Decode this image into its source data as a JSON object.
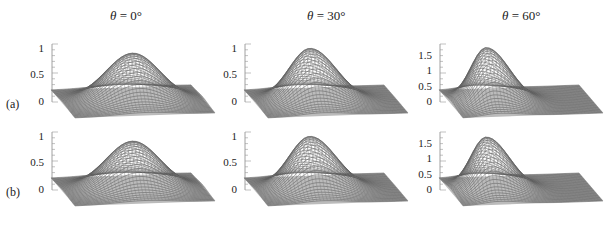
{
  "chart_data": {
    "type": "surface3d",
    "columns": [
      {
        "title_var": "θ",
        "title_rest": " = 0°",
        "theta_deg": 0
      },
      {
        "title_var": "θ",
        "title_rest": " = 30°",
        "theta_deg": 30
      },
      {
        "title_var": "θ",
        "title_rest": " = 60°",
        "theta_deg": 60
      }
    ],
    "rows": [
      {
        "label": "(a)"
      },
      {
        "label": "(b)"
      }
    ],
    "panels": [
      {
        "row": 0,
        "col": 0,
        "zticks": [
          "1",
          "0.5",
          "0"
        ],
        "zmax": 1.0,
        "peak": 0.9,
        "skew": 0.0,
        "width": 0.55
      },
      {
        "row": 0,
        "col": 1,
        "zticks": [
          "1",
          "0.5",
          "0"
        ],
        "zmax": 1.0,
        "peak": 1.0,
        "skew": 0.25,
        "width": 0.42
      },
      {
        "row": 0,
        "col": 2,
        "zticks": [
          "1.5",
          "1",
          "0.5",
          "0"
        ],
        "zmax": 1.8,
        "peak": 1.85,
        "skew": 0.55,
        "width": 0.3
      },
      {
        "row": 1,
        "col": 0,
        "zticks": [
          "1",
          "0.5",
          "0"
        ],
        "zmax": 1.0,
        "peak": 0.9,
        "skew": 0.0,
        "width": 0.55
      },
      {
        "row": 1,
        "col": 1,
        "zticks": [
          "1",
          "0.5",
          "0"
        ],
        "zmax": 1.0,
        "peak": 1.0,
        "skew": 0.25,
        "width": 0.42
      },
      {
        "row": 1,
        "col": 2,
        "zticks": [
          "1.5",
          "1",
          "0.5",
          "0"
        ],
        "zmax": 1.8,
        "peak": 1.8,
        "skew": 0.55,
        "width": 0.3
      }
    ],
    "xlabel": "",
    "ylabel": "",
    "zlabel": "",
    "grid": false,
    "legend": null
  }
}
